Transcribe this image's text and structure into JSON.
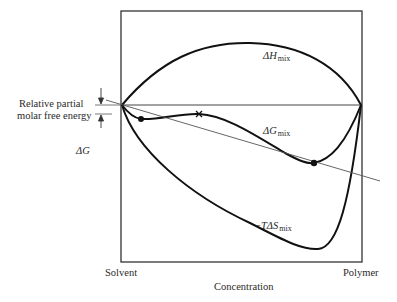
{
  "figure": {
    "type": "free-energy-of-mixing-diagram",
    "x_axis": {
      "title": "Concentration",
      "left_label": "Solvent",
      "right_label": "Polymer"
    },
    "curves": [
      {
        "id": "enthalpy",
        "symbol": "ΔH",
        "subscript": "mix",
        "prefix": ""
      },
      {
        "id": "gibbs",
        "symbol": "ΔG",
        "subscript": "mix",
        "prefix": ""
      },
      {
        "id": "entropy",
        "symbol": "TΔS",
        "subscript": "mix",
        "prefix": "−"
      }
    ],
    "annotations": {
      "relative_partial_line1": "Relative partial",
      "relative_partial_line2": "molar free energy",
      "delta_g": "ΔG"
    },
    "markers": {
      "tangent_points": 2,
      "inflection_marker": "×"
    },
    "colors": {
      "line": "#111111",
      "tangent": "#555555",
      "frame": "#333333"
    }
  }
}
